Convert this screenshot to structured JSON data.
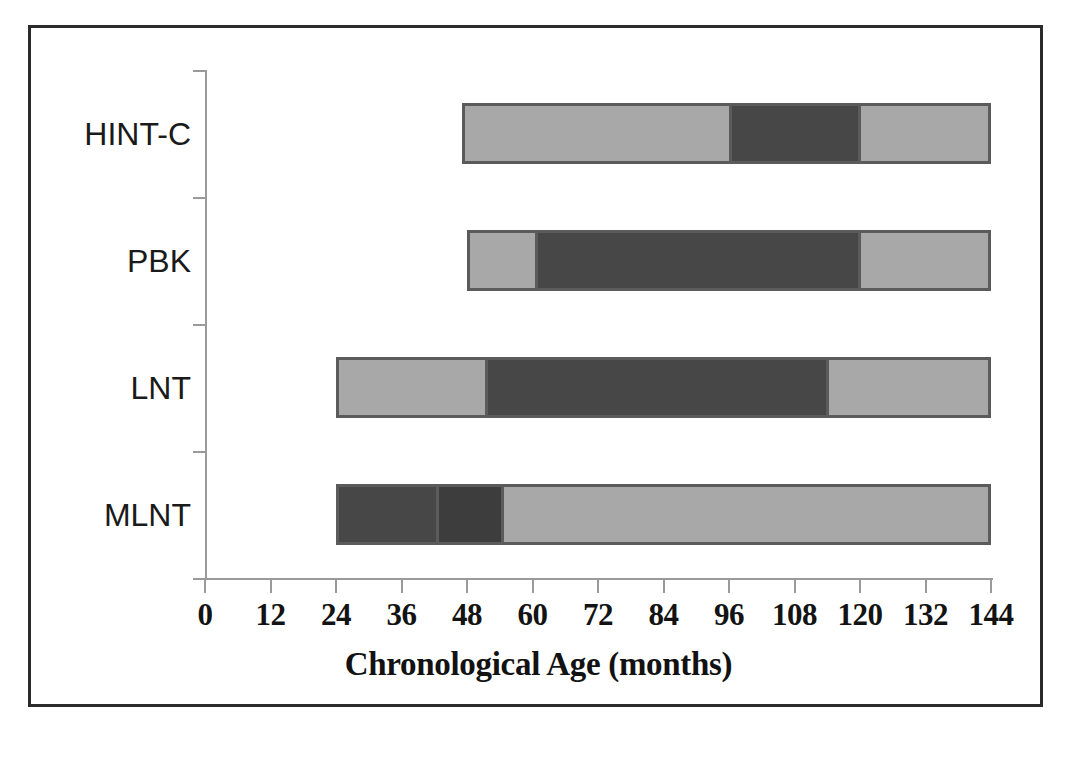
{
  "chart_data": {
    "type": "bar",
    "orientation": "horizontal",
    "subtype": "stacked-range",
    "title": "",
    "xlabel": "Chronological Age (months)",
    "ylabel": "",
    "xlim": [
      0,
      144
    ],
    "xticks": [
      0,
      12,
      24,
      36,
      48,
      60,
      72,
      84,
      96,
      108,
      120,
      132,
      144
    ],
    "xtick_labels": [
      "0",
      "12",
      "24",
      "36",
      "48",
      "60",
      "72",
      "84",
      "96",
      "108",
      "120",
      "132",
      "144"
    ],
    "grid": false,
    "legend": "none",
    "categories": [
      "HINT-C",
      "PBK",
      "LNT",
      "MLNT"
    ],
    "colors": {
      "light": "#a8a8a8",
      "dark": "#474747",
      "border": "#5b5b5b",
      "axis": "#9a9a9a",
      "frame": "#2b2b2b",
      "text": "#131313",
      "background": "#ffffff"
    },
    "bars": [
      {
        "category": "HINT-C",
        "start": 47,
        "end": 144,
        "segments": [
          {
            "from": 47,
            "to": 96,
            "shade": "light"
          },
          {
            "from": 96,
            "to": 120,
            "shade": "dark"
          },
          {
            "from": 120,
            "to": 144,
            "shade": "light"
          }
        ]
      },
      {
        "category": "PBK",
        "start": 48,
        "end": 144,
        "segments": [
          {
            "from": 48,
            "to": 60,
            "shade": "light"
          },
          {
            "from": 60,
            "to": 120,
            "shade": "dark"
          },
          {
            "from": 120,
            "to": 144,
            "shade": "light"
          }
        ]
      },
      {
        "category": "LNT",
        "start": 24,
        "end": 144,
        "segments": [
          {
            "from": 24,
            "to": 51,
            "shade": "light"
          },
          {
            "from": 51,
            "to": 114,
            "shade": "dark"
          },
          {
            "from": 114,
            "to": 144,
            "shade": "light"
          }
        ]
      },
      {
        "category": "MLNT",
        "start": 24,
        "end": 144,
        "segments": [
          {
            "from": 24,
            "to": 42,
            "shade": "dark"
          },
          {
            "from": 42,
            "to": 54,
            "shade": "darker"
          },
          {
            "from": 54,
            "to": 144,
            "shade": "light"
          }
        ]
      }
    ]
  },
  "axis": {
    "x_title": "Chronological Age (months)"
  }
}
